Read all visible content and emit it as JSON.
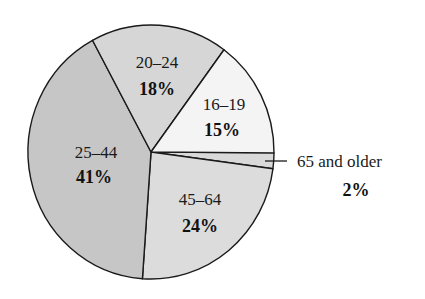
{
  "chart_data": {
    "type": "pie",
    "title": "",
    "start_angle_deg": 0,
    "direction": "clockwise_from_3_oclock",
    "categories": [
      "65 and older",
      "45–64",
      "25–44",
      "20–24",
      "16–19"
    ],
    "values": [
      2,
      24,
      41,
      18,
      15
    ],
    "unit": "%",
    "slices": [
      {
        "label": "65 and older",
        "value": 2,
        "pct_text": "2%",
        "color": "#d9d9d9",
        "label_position": "outside_leader"
      },
      {
        "label": "45–64",
        "value": 24,
        "pct_text": "24%",
        "color": "#dcdcdc",
        "label_position": "inside"
      },
      {
        "label": "25–44",
        "value": 41,
        "pct_text": "41%",
        "color": "#c6c6c6",
        "label_position": "inside"
      },
      {
        "label": "20–24",
        "value": 18,
        "pct_text": "18%",
        "color": "#d6d6d6",
        "label_position": "inside"
      },
      {
        "label": "16–19",
        "value": 15,
        "pct_text": "15%",
        "color": "#f4f4f4",
        "label_position": "inside"
      }
    ],
    "legend": "none",
    "stroke_color": "#1a1a1a"
  }
}
